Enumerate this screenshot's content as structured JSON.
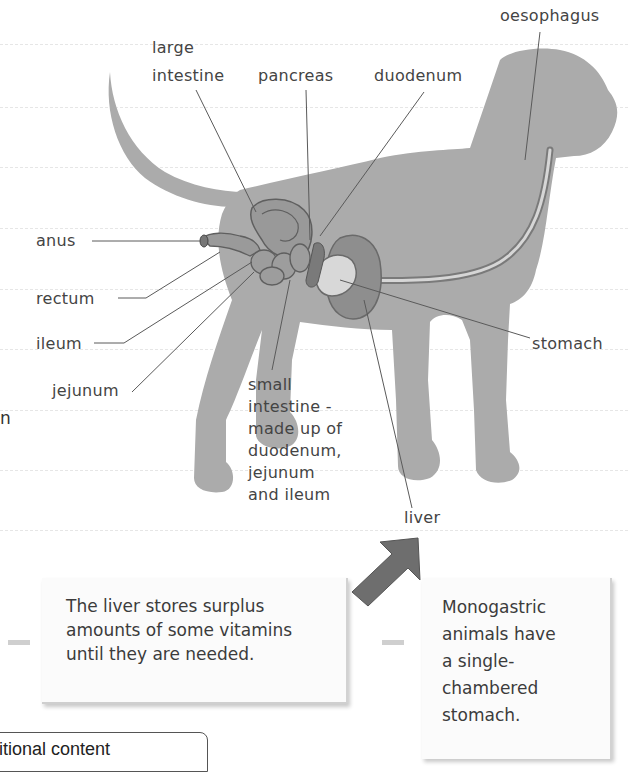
{
  "page": {
    "type": "textbook diagram"
  },
  "diagram": {
    "labels": {
      "oesophagus": "oesophagus",
      "large_intestine_line1": "large",
      "large_intestine_line2": "intestine",
      "pancreas": "pancreas",
      "duodenum": "duodenum",
      "anus": "anus",
      "rectum": "rectum",
      "ileum": "ileum",
      "jejunum": "jejunum",
      "stomach": "stomach",
      "liver": "liver",
      "small_intestine": [
        "small",
        "intestine -",
        "made up of",
        "duodenum,",
        "jejunum",
        "and ileum"
      ]
    },
    "colors": {
      "body": "#a9a9a9",
      "organ_dark": "#8a8a8a",
      "organ_light": "#d4d4d4",
      "leader_line": "#555555",
      "arrow": "#6a6a6a"
    }
  },
  "callouts": {
    "liver_fact": [
      "The liver stores surplus",
      "amounts of some vitamins",
      "until they are needed."
    ],
    "monogastric_fact": [
      "Monogastric",
      "animals have",
      "a single-",
      "chambered",
      "stomach."
    ]
  },
  "left_edge_fragment": "n",
  "bottom_box": {
    "text": "itional content"
  }
}
